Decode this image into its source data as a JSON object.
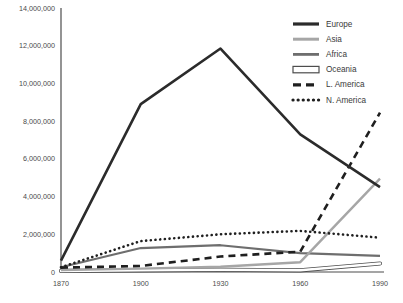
{
  "chart_data": {
    "type": "line",
    "title": "",
    "subtitle": "",
    "xlabel": "",
    "ylabel": "",
    "x": [
      1870,
      1900,
      1930,
      1960,
      1990
    ],
    "categories": [
      "1870",
      "1900",
      "1930",
      "1960",
      "1990"
    ],
    "xtick_labels": [
      "1870",
      "1900",
      "1930",
      "1960",
      "1990"
    ],
    "ytick_labels": [
      "0",
      "2,000,000",
      "4,000,000",
      "6,000,000",
      "8,000,000",
      "10,000,000",
      "12,000,000",
      "14,000,000"
    ],
    "ytick_values": [
      0,
      2000000,
      4000000,
      6000000,
      8000000,
      10000000,
      12000000,
      14000000
    ],
    "ylim": [
      0,
      14000000
    ],
    "xlim": [
      1870,
      1990
    ],
    "grid": false,
    "legend_position": "top-right",
    "series": [
      {
        "name": "Europe",
        "style": "solid",
        "color": "#2b2b2b",
        "width": 2.6,
        "values": [
          600000,
          8900000,
          11850000,
          7300000,
          4500000
        ]
      },
      {
        "name": "Asia",
        "style": "solid",
        "color": "#a6a6a6",
        "width": 2.4,
        "values": [
          100000,
          180000,
          280000,
          520000,
          4950000
        ]
      },
      {
        "name": "Africa",
        "style": "solid",
        "color": "#6e6e6e",
        "width": 2.2,
        "values": [
          250000,
          1270000,
          1420000,
          1000000,
          850000
        ]
      },
      {
        "name": "Oceania",
        "style": "outline",
        "color": "#ffffff",
        "outline": "#4d4d4d",
        "width": 2.6,
        "values": [
          60000,
          90000,
          120000,
          90000,
          450000
        ]
      },
      {
        "name": "L. America",
        "style": "dashed",
        "color": "#1f1f1f",
        "width": 2.6,
        "values": [
          230000,
          320000,
          820000,
          1080000,
          8450000
        ]
      },
      {
        "name": "N. America",
        "style": "dotted",
        "color": "#1f1f1f",
        "width": 2.6,
        "values": [
          250000,
          1640000,
          2000000,
          2180000,
          1820000
        ]
      }
    ]
  },
  "legend": {
    "items": [
      {
        "label": "Europe"
      },
      {
        "label": "Asia"
      },
      {
        "label": "Africa"
      },
      {
        "label": "Oceania"
      },
      {
        "label": "L. America"
      },
      {
        "label": "N. America"
      }
    ]
  }
}
